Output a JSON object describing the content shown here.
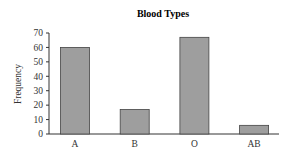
{
  "chart_data": {
    "type": "bar",
    "title": "Blood Types",
    "xlabel": "",
    "ylabel": "Frequency",
    "categories": [
      "A",
      "B",
      "O",
      "AB"
    ],
    "values": [
      60,
      17,
      67,
      6
    ],
    "ylim": [
      0,
      70
    ],
    "yticks": [
      0,
      10,
      20,
      30,
      40,
      50,
      60,
      70
    ],
    "grid": false,
    "legend": null,
    "colors": {
      "bar_fill": "#9e9e9e",
      "bar_stroke": "#444444",
      "axis": "#333333"
    }
  }
}
